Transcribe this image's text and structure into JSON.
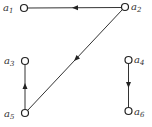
{
  "diagram": {
    "type": "directed-graph",
    "nodes": [
      {
        "id": "a1",
        "base": "a",
        "sub": "1",
        "x": 24,
        "y": 8
      },
      {
        "id": "a2",
        "base": "a",
        "sub": "2",
        "x": 125,
        "y": 7
      },
      {
        "id": "a3",
        "base": "a",
        "sub": "3",
        "x": 25,
        "y": 61
      },
      {
        "id": "a4",
        "base": "a",
        "sub": "4",
        "x": 128,
        "y": 60
      },
      {
        "id": "a5",
        "base": "a",
        "sub": "5",
        "x": 25,
        "y": 113
      },
      {
        "id": "a6",
        "base": "a",
        "sub": "6",
        "x": 129,
        "y": 111
      }
    ],
    "edges": [
      {
        "from": "a2",
        "to": "a1"
      },
      {
        "from": "a2",
        "to": "a5"
      },
      {
        "from": "a5",
        "to": "a3"
      },
      {
        "from": "a4",
        "to": "a6"
      }
    ],
    "colors": {
      "stroke": "#333333",
      "background": "#ffffff"
    }
  }
}
